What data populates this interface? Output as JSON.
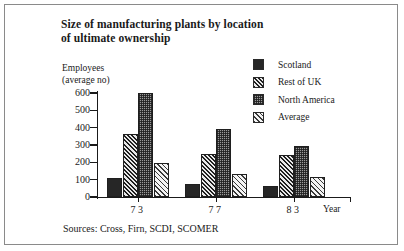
{
  "title": {
    "line1": "Size of manufacturing plants by location",
    "line2": "of ultimate ownership"
  },
  "axis_caption": {
    "line1": "Employees",
    "line2": "(average no)"
  },
  "source_note": "Sources: Cross, Firn, SCDI, SCOMER",
  "legend": {
    "items": [
      {
        "label": "Scotland",
        "swatch": "solid-black-swatch"
      },
      {
        "label": "Rest of UK",
        "swatch": "dense-diagonal-hatch-swatch"
      },
      {
        "label": "North America",
        "swatch": "checkerboard-stipple-swatch"
      },
      {
        "label": "Average",
        "swatch": "light-diagonal-hatch-swatch"
      }
    ]
  },
  "chart_data": {
    "type": "bar",
    "title": "Size of manufacturing plants by location of ultimate ownership",
    "categories": [
      "73",
      "77",
      "83"
    ],
    "series": [
      {
        "name": "Scotland",
        "values": [
          110,
          75,
          65
        ]
      },
      {
        "name": "Rest of UK",
        "values": [
          365,
          250,
          245
        ]
      },
      {
        "name": "North America",
        "values": [
          600,
          390,
          295
        ]
      },
      {
        "name": "Average",
        "values": [
          195,
          135,
          113
        ]
      }
    ],
    "xlabel": "Year",
    "ylabel": "Employees (average no)",
    "ylim": [
      0,
      600
    ],
    "yticks": [
      0,
      100,
      200,
      300,
      400,
      500,
      600
    ],
    "xticklabels": [
      "73",
      "77",
      "83"
    ],
    "grid": false,
    "legend_position": "top-right",
    "source": "Sources: Cross, Firn, SCDI, SCOMER"
  },
  "colors": {
    "ink": "#1a1a1a",
    "frame": "#8a8a8a",
    "scotland": "#262626",
    "north_america": "#9a9a9a",
    "background": "#ffffff"
  }
}
